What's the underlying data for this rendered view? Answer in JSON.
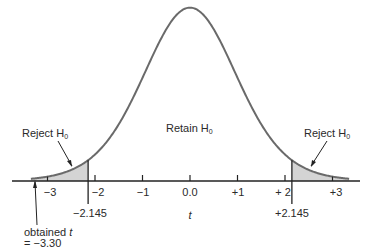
{
  "diagram": {
    "type": "t-distribution two-tailed rejection regions",
    "regions": {
      "left": {
        "label": "Reject H",
        "subscript": "0"
      },
      "center": {
        "label": "Retain H",
        "subscript": "0"
      },
      "right": {
        "label": "Reject H",
        "subscript": "0"
      }
    },
    "axis": {
      "label": "t",
      "ticks": [
        {
          "value": -3,
          "label": "−3"
        },
        {
          "value": -2,
          "label": "−2"
        },
        {
          "value": -1,
          "label": "−1"
        },
        {
          "value": 0,
          "label": "0.0"
        },
        {
          "value": 1,
          "label": "+1"
        },
        {
          "value": 2,
          "label": "+ 2"
        },
        {
          "value": 3,
          "label": "+3"
        }
      ],
      "critical_values": [
        {
          "value": -2.145,
          "label": "−2.145"
        },
        {
          "value": 2.145,
          "label": "+2.145"
        }
      ]
    },
    "annotation": {
      "line1": "obtained ",
      "line1_var": "t",
      "line2": "= −3.30",
      "value": -3.3
    },
    "colors": {
      "curve": "#6a6a6a",
      "shade": "#d4d4d4",
      "axis": "#222222"
    }
  }
}
